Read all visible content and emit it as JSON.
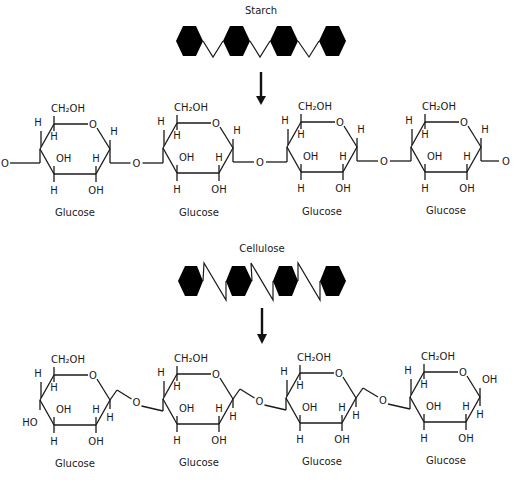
{
  "starch": {
    "title": "Starch",
    "linkage": "alpha-1,4",
    "unit_count": 4,
    "units": [
      {
        "label": "Glucose"
      },
      {
        "label": "Glucose"
      },
      {
        "label": "Glucose"
      },
      {
        "label": "Glucose"
      }
    ],
    "atoms": {
      "ch2oh": "CH₂OH",
      "ring_o": "O",
      "bridge_o": "O",
      "oh": "OH",
      "h": "H"
    }
  },
  "cellulose": {
    "title": "Cellulose",
    "linkage": "beta-1,4",
    "unit_count": 4,
    "units": [
      {
        "label": "Glucose"
      },
      {
        "label": "Glucose"
      },
      {
        "label": "Glucose"
      },
      {
        "label": "Glucose"
      }
    ],
    "atoms": {
      "ch2oh": "CH₂OH",
      "ring_o": "O",
      "bridge_o": "O",
      "oh": "OH",
      "ho": "HO",
      "h": "H"
    }
  },
  "colors": {
    "ink": "#1a1a1a",
    "hexagon_fill": "#000000",
    "background": "#ffffff"
  }
}
